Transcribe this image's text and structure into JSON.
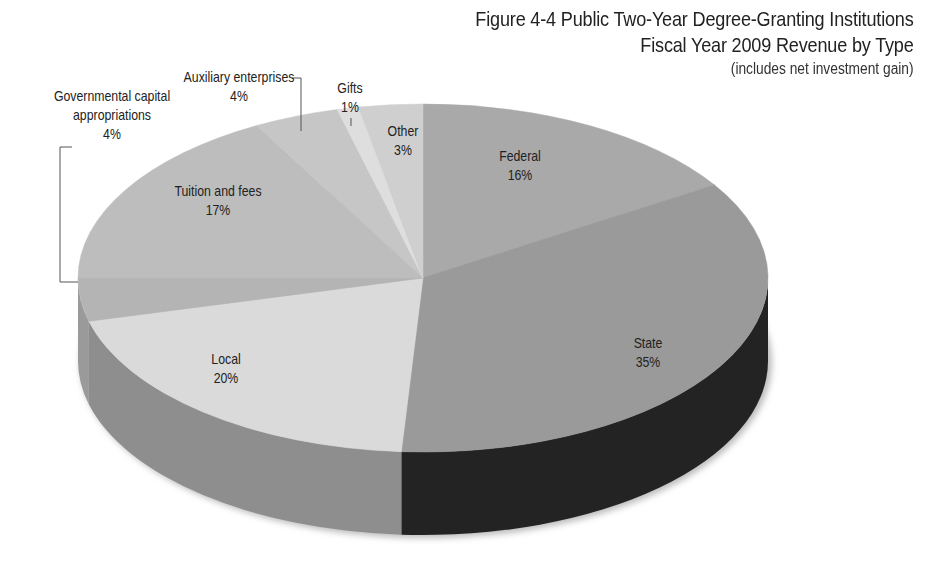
{
  "chart_data": {
    "type": "pie",
    "title": "Figure 4-4 Public Two-Year Degree-Granting Institutions",
    "subtitle": "Fiscal Year 2009 Revenue by Type",
    "note": "(includes net investment gain)",
    "style": "3d",
    "slices": [
      {
        "label": "Federal",
        "value": 16,
        "pct_label": "16%",
        "color": "#a9a9a9",
        "side": "#8c8c8c"
      },
      {
        "label": "State",
        "value": 35,
        "pct_label": "35%",
        "color": "#9a9a9a",
        "side": "#232323"
      },
      {
        "label": "Local",
        "value": 20,
        "pct_label": "20%",
        "color": "#dadada",
        "side": "#8e8e8e"
      },
      {
        "label": "Governmental capital appropriations",
        "value": 4,
        "pct_label": "4%",
        "color": "#b4b4b4",
        "side": "#9a9a9a"
      },
      {
        "label": "Tuition and fees",
        "value": 17,
        "pct_label": "17%",
        "color": "#bdbdbd",
        "side": "#a0a0a0"
      },
      {
        "label": "Auxiliary enterprises",
        "value": 4,
        "pct_label": "4%",
        "color": "#c6c6c6",
        "side": "#a8a8a8"
      },
      {
        "label": "Gifts",
        "value": 1,
        "pct_label": "1%",
        "color": "#dedede",
        "side": "#bcbcbc"
      },
      {
        "label": "Other",
        "value": 3,
        "pct_label": "3%",
        "color": "#cfcfcf",
        "side": "#b0b0b0"
      }
    ],
    "start_angle_deg": -90,
    "direction": "clockwise"
  },
  "labels": {
    "federal": {
      "name": "Federal",
      "pct": "16%"
    },
    "state": {
      "name": "State",
      "pct": "35%"
    },
    "local": {
      "name": "Local",
      "pct": "20%"
    },
    "gov_capital": {
      "name_line1": "Governmental capital",
      "name_line2": "appropriations",
      "pct": "4%"
    },
    "tuition": {
      "name": "Tuition and fees",
      "pct": "17%"
    },
    "auxiliary": {
      "name": "Auxiliary enterprises",
      "pct": "4%"
    },
    "gifts": {
      "name": "Gifts",
      "pct": "1%"
    },
    "other": {
      "name": "Other",
      "pct": "3%"
    }
  }
}
